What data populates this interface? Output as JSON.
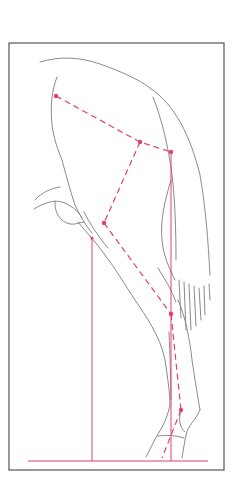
{
  "figure": {
    "subject": "Horse hind leg conformation diagram",
    "colors": {
      "background": "#ffffff",
      "frame": "#555555",
      "outline": "#8a8a8a",
      "construction": "#e0406e"
    },
    "frame": {
      "x": 9,
      "y": 43,
      "width": 215,
      "height": 427
    },
    "ground_line": {
      "x1": 28,
      "y1": 461,
      "x2": 208,
      "y2": 461
    },
    "plumb_lines": [
      {
        "name": "buttock-plumb",
        "x": 92,
        "y1": 238,
        "y2": 461
      },
      {
        "name": "hock-plumb",
        "x": 171,
        "y1": 152,
        "y2": 461
      }
    ],
    "points": [
      {
        "name": "hip",
        "x": 56,
        "y": 96
      },
      {
        "name": "hip-joint",
        "x": 140,
        "y": 142
      },
      {
        "name": "point-of-buttock",
        "x": 171,
        "y": 152
      },
      {
        "name": "stifle",
        "x": 104,
        "y": 223
      },
      {
        "name": "hock",
        "x": 171,
        "y": 314
      },
      {
        "name": "fetlock",
        "x": 181,
        "y": 410
      }
    ]
  }
}
